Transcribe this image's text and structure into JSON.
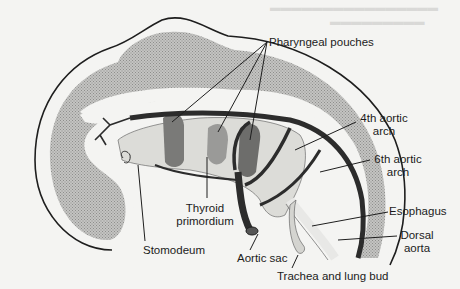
{
  "diagram": {
    "background_color": "#f4f4f2",
    "colors": {
      "outline": "#1e1e1e",
      "mesoderm_stipple": "#b9b9b7",
      "pouch_dark": "#7a7a78",
      "pouch_medium": "#9a9a98",
      "vessel": "#2c2c2c",
      "endoderm_light": "#dcdcd8"
    },
    "labels": {
      "pharyngeal_pouches": "Pharyngeal pouches",
      "fourth_aortic_arch_1": "4th aortic",
      "fourth_aortic_arch_2": "arch",
      "sixth_aortic_arch_1": "6th aortic",
      "sixth_aortic_arch_2": "arch",
      "esophagus": "Esophagus",
      "dorsal_aorta_1": "Dorsal",
      "dorsal_aorta_2": "aorta",
      "thyroid_primordium_1": "Thyroid",
      "thyroid_primordium_2": "primordium",
      "stomodeum": "Stomodeum",
      "aortic_sac": "Aortic sac",
      "trachea_lung_bud": "Trachea and lung bud"
    }
  }
}
